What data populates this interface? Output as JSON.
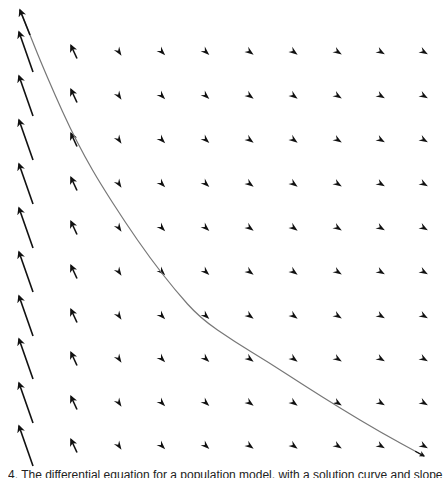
{
  "figure": {
    "type": "slope-field",
    "caption": "4. The differential equation for a population model, with a solution curve and slope field",
    "colors": {
      "background": "#ffffff",
      "arrow": "#111111",
      "curve": "#777777"
    }
  },
  "grid": {
    "columns_x": [
      26,
      74,
      119,
      162,
      206,
      250,
      294,
      338,
      381,
      424
    ],
    "rows_y": [
      52,
      96,
      140,
      184,
      228,
      272,
      316,
      359,
      403,
      446
    ],
    "column_vectors": [
      {
        "dx": -14,
        "dy": -40,
        "type": "long-arrow"
      },
      {
        "dx": -6,
        "dy": -13,
        "type": "short-arrow"
      },
      {
        "dx": 4,
        "dy": 6,
        "type": "head-only"
      },
      {
        "dx": 5,
        "dy": 5,
        "type": "head-only"
      },
      {
        "dx": 5,
        "dy": 4.5,
        "type": "head-only"
      },
      {
        "dx": 5.5,
        "dy": 4,
        "type": "head-only"
      },
      {
        "dx": 5.5,
        "dy": 4,
        "type": "head-only"
      },
      {
        "dx": 6,
        "dy": 3.8,
        "type": "head-only"
      },
      {
        "dx": 6,
        "dy": 3.6,
        "type": "head-only"
      },
      {
        "dx": 6,
        "dy": 3.5,
        "type": "head-only"
      }
    ]
  },
  "solution_curve": {
    "label": "solution-curve",
    "points": [
      [
        20,
        10
      ],
      [
        30,
        35
      ],
      [
        40,
        60
      ],
      [
        55,
        95
      ],
      [
        70,
        128
      ],
      [
        85,
        157
      ],
      [
        100,
        183
      ],
      [
        125,
        222
      ],
      [
        150,
        258
      ],
      [
        175,
        290
      ],
      [
        200,
        318
      ],
      [
        235,
        342
      ],
      [
        268,
        362
      ],
      [
        305,
        386
      ],
      [
        340,
        408
      ],
      [
        380,
        432
      ],
      [
        424,
        456
      ]
    ],
    "start_arrowhead": true
  }
}
